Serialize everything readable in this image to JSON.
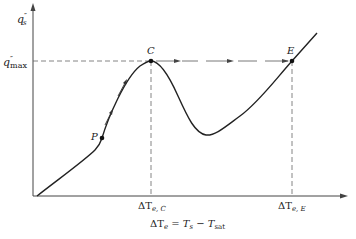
{
  "diagram": {
    "axes": {
      "y_label_main": "q",
      "y_label_prime": "″",
      "y_label_sub": "s",
      "x_label_lhs": "ΔT",
      "x_label_lhs_sub": "e",
      "x_label_eq": "=",
      "x_label_t1": "T",
      "x_label_t1_sub": "s",
      "x_label_minus": "−",
      "x_label_t2": "T",
      "x_label_t2_sub": "sat"
    },
    "levels": {
      "qmax_main": "q",
      "qmax_prime": "″",
      "qmax_sub": "max"
    },
    "ticks": {
      "c_main": "ΔT",
      "c_sub": "e, C",
      "e_main": "ΔT",
      "e_sub": "e, E"
    },
    "points": {
      "P": "P",
      "C": "C",
      "E": "E"
    },
    "colors": {
      "line": "#222222",
      "dash": "#555555",
      "background": "#ffffff"
    }
  }
}
